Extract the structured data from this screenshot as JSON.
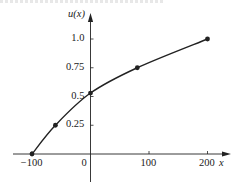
{
  "chart_data": {
    "type": "line",
    "title": "",
    "xlabel": "x",
    "ylabel": "u(x)",
    "x": [
      -100,
      -60,
      0,
      80,
      200
    ],
    "series": [
      {
        "name": "u(x)",
        "values": [
          0.0,
          0.25,
          0.53,
          0.75,
          1.0
        ],
        "markers": true,
        "smooth": true
      }
    ],
    "x_ticks": [
      -100,
      0,
      100,
      200
    ],
    "x_tick_labels": [
      "-100",
      "0",
      "100",
      "200"
    ],
    "y_ticks": [
      0.25,
      0.5,
      0.75,
      1.0
    ],
    "y_tick_labels": [
      "0.25",
      "0.5",
      "0.75",
      "1.0"
    ],
    "xlim": [
      -130,
      230
    ],
    "ylim": [
      -0.25,
      1.2
    ],
    "grid": false,
    "legend": null,
    "line_color": "#222222"
  },
  "labels": {
    "y_axis": "u(x)",
    "x_axis": "x",
    "origin": "0"
  }
}
